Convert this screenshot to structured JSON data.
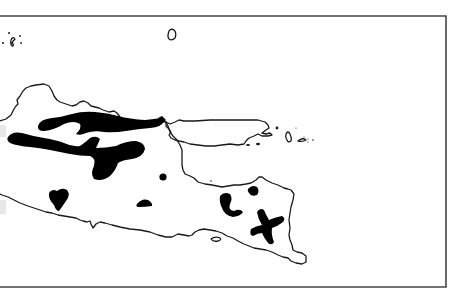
{
  "map": {
    "title": "",
    "description": "Outline map of East Java and Madura with black distribution patches",
    "colors": {
      "background": "#ffffff",
      "coastline": "#1a1a1a",
      "patches": "#000000",
      "frame": "#444444"
    },
    "frame": {
      "top": 16,
      "bottom": 287,
      "right": 446,
      "left_open": true
    },
    "regions": [
      {
        "name": "java-mainland",
        "type": "coastline"
      },
      {
        "name": "madura-island",
        "type": "coastline"
      },
      {
        "name": "bawean-island",
        "type": "coastline"
      },
      {
        "name": "karimunjawa-islets",
        "type": "coastline"
      },
      {
        "name": "kangean-islets",
        "type": "coastline"
      },
      {
        "name": "nusa-barung-island",
        "type": "coastline"
      }
    ],
    "patches_count": 9
  }
}
